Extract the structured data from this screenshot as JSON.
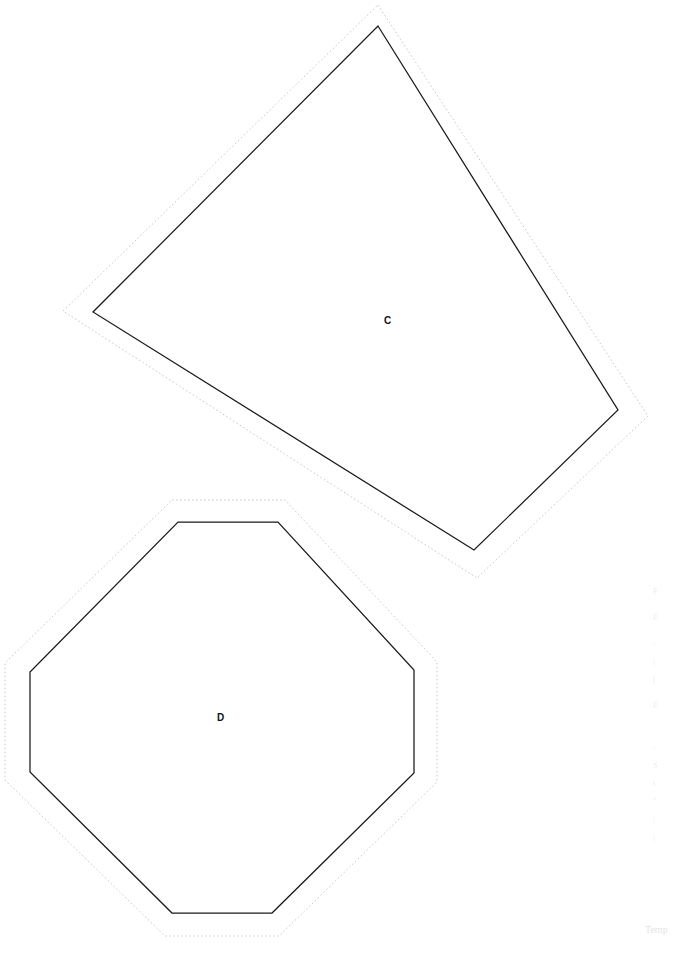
{
  "page": {
    "width": 679,
    "height": 955,
    "background": "#ffffff",
    "kind": "cut-out shape template sheet"
  },
  "colors": {
    "solid_outline": "#1a1a1a",
    "dotted_outline": "#c9c9c9",
    "label_text": "#111111",
    "faint_text": "#ededed"
  },
  "shapes": [
    {
      "id": "shape-c",
      "label": "C",
      "type": "quadrilateral",
      "label_position": {
        "x": 384,
        "y": 316
      },
      "solid_vertices": [
        {
          "x": 378,
          "y": 26
        },
        {
          "x": 618,
          "y": 410
        },
        {
          "x": 474,
          "y": 550
        },
        {
          "x": 93,
          "y": 312
        }
      ],
      "dotted_vertices": [
        {
          "x": 378,
          "y": 5
        },
        {
          "x": 648,
          "y": 416
        },
        {
          "x": 477,
          "y": 578
        },
        {
          "x": 63,
          "y": 311
        }
      ]
    },
    {
      "id": "shape-d",
      "label": "D",
      "type": "octagon",
      "label_position": {
        "x": 217,
        "y": 713
      },
      "solid_vertices": [
        {
          "x": 178,
          "y": 522
        },
        {
          "x": 278,
          "y": 522
        },
        {
          "x": 414,
          "y": 670
        },
        {
          "x": 414,
          "y": 773
        },
        {
          "x": 272,
          "y": 913
        },
        {
          "x": 172,
          "y": 913
        },
        {
          "x": 30,
          "y": 772
        },
        {
          "x": 30,
          "y": 672
        }
      ],
      "dotted_vertices": [
        {
          "x": 172,
          "y": 500
        },
        {
          "x": 285,
          "y": 500
        },
        {
          "x": 437,
          "y": 662
        },
        {
          "x": 437,
          "y": 782
        },
        {
          "x": 279,
          "y": 936
        },
        {
          "x": 165,
          "y": 936
        },
        {
          "x": 5,
          "y": 780
        },
        {
          "x": 5,
          "y": 663
        }
      ]
    }
  ],
  "margin_notes": [
    {
      "text": "F"
    },
    {
      "text": "F"
    },
    {
      "text": "-"
    },
    {
      "text": "|"
    },
    {
      "text": "("
    },
    {
      "text": "F"
    },
    {
      "text": "-"
    },
    {
      "text": "S"
    },
    {
      "text": "t"
    },
    {
      "text": "\""
    },
    {
      "text": "|"
    },
    {
      "text": "|"
    }
  ],
  "footer_note": {
    "text": "Temp"
  },
  "header_note": {
    "text": ""
  }
}
